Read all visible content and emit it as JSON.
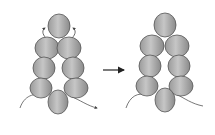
{
  "diagram": {
    "type": "beading-step",
    "colors": {
      "bead_fill_light": "#c4c4c4",
      "bead_fill_dark": "#8e8e8e",
      "bead_stroke": "#555555",
      "thread": "#555555",
      "arrow": "#222222",
      "background": "#ffffff"
    },
    "panels": [
      {
        "name": "before",
        "beads": [
          {
            "cx": 59,
            "cy": 26,
            "rx": 11,
            "ry": 12
          },
          {
            "cx": 47,
            "cy": 48,
            "rx": 12,
            "ry": 11
          },
          {
            "cx": 69,
            "cy": 48,
            "rx": 12,
            "ry": 11
          },
          {
            "cx": 44,
            "cy": 68,
            "rx": 11,
            "ry": 11
          },
          {
            "cx": 73,
            "cy": 68,
            "rx": 11,
            "ry": 11
          },
          {
            "cx": 41,
            "cy": 88,
            "rx": 11,
            "ry": 10
          },
          {
            "cx": 76,
            "cy": 88,
            "rx": 12,
            "ry": 10
          },
          {
            "cx": 58,
            "cy": 102,
            "rx": 10,
            "ry": 12
          }
        ]
      },
      {
        "name": "after",
        "beads": [
          {
            "cx": 165,
            "cy": 25,
            "rx": 11,
            "ry": 12
          },
          {
            "cx": 152,
            "cy": 46,
            "rx": 12,
            "ry": 11
          },
          {
            "cx": 177,
            "cy": 46,
            "rx": 12,
            "ry": 11
          },
          {
            "cx": 150,
            "cy": 66,
            "rx": 11,
            "ry": 11
          },
          {
            "cx": 179,
            "cy": 66,
            "rx": 11,
            "ry": 11
          },
          {
            "cx": 147,
            "cy": 86,
            "rx": 11,
            "ry": 10
          },
          {
            "cx": 181,
            "cy": 86,
            "rx": 12,
            "ry": 10
          },
          {
            "cx": 165,
            "cy": 100,
            "rx": 10,
            "ry": 12
          }
        ]
      }
    ],
    "arrow": {
      "x1": 103,
      "y1": 70,
      "x2": 124,
      "y2": 70,
      "label": "transition-arrow"
    }
  }
}
